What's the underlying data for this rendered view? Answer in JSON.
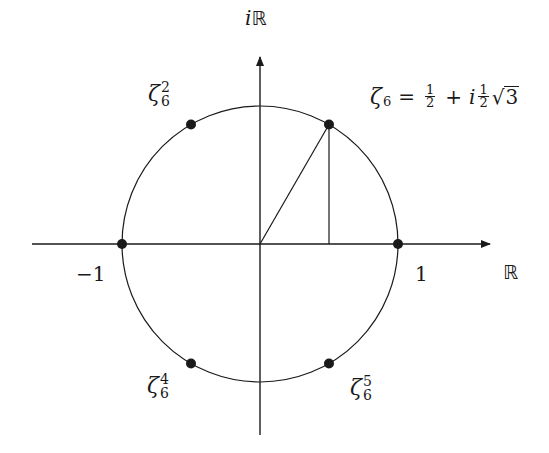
{
  "diagram": {
    "axes": {
      "real_label": "ℝ",
      "imag_label_prefix": "i",
      "imag_label_symbol": "ℝ"
    },
    "ticks": {
      "neg_one": "−1",
      "pos_one": "1"
    },
    "geometry": {
      "center": [
        260,
        244
      ],
      "radius": 138,
      "real_axis_x": [
        32,
        490
      ],
      "imag_axis_y": [
        57,
        435
      ]
    },
    "points": [
      {
        "name": "zeta6-1",
        "angle_deg": 60,
        "label": "ζ",
        "sup": "",
        "sub": "6"
      },
      {
        "name": "zeta6-2",
        "angle_deg": 120,
        "label": "ζ",
        "sup": "2",
        "sub": "6"
      },
      {
        "name": "zeta6-3",
        "angle_deg": 180,
        "label": "",
        "sup": "",
        "sub": ""
      },
      {
        "name": "zeta6-4",
        "angle_deg": 240,
        "label": "ζ",
        "sup": "4",
        "sub": "6"
      },
      {
        "name": "zeta6-5",
        "angle_deg": 300,
        "label": "ζ",
        "sup": "5",
        "sub": "6"
      },
      {
        "name": "zeta6-6",
        "angle_deg": 0,
        "label": "",
        "sup": "",
        "sub": ""
      }
    ],
    "labels": {
      "zeta2": {
        "base": "ζ",
        "sup": "2",
        "sub": "6"
      },
      "zeta4": {
        "base": "ζ",
        "sup": "4",
        "sub": "6"
      },
      "zeta5": {
        "base": "ζ",
        "sup": "5",
        "sub": "6"
      }
    },
    "formula": {
      "lhs_base": "ζ",
      "lhs_sub": "6",
      "equals": "=",
      "frac1_num": "1",
      "frac1_den": "2",
      "plus": "+",
      "i": "i",
      "frac2_num": "1",
      "frac2_den": "2",
      "sqrt_sign": "√",
      "radicand": "3"
    },
    "colors": {
      "ink": "#1a1a1a",
      "background": "#ffffff"
    }
  }
}
